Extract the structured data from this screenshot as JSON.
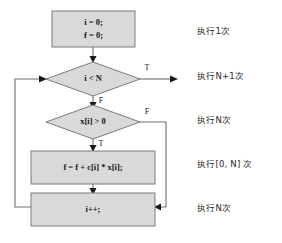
{
  "diagram": {
    "colors": {
      "node_fill": "#d9d9d9",
      "node_stroke": "#7a7a7a",
      "connector": "#6e6e6e",
      "text": "#141414",
      "background": "#ffffff"
    },
    "nodes": {
      "init": {
        "type": "process",
        "line1": "i = 0;",
        "line2": "f = 0;"
      },
      "loop_condition": {
        "type": "decision",
        "text": "i < N",
        "true_label": "T",
        "false_label": "F"
      },
      "value_condition": {
        "type": "decision",
        "text": "x[i] > 0",
        "true_label": "T",
        "false_label": "F"
      },
      "accumulate": {
        "type": "process",
        "text": "f = f + c[i] * x[i];"
      },
      "increment": {
        "type": "process",
        "text": "i++;"
      }
    },
    "annotations": [
      {
        "label": "执行1次"
      },
      {
        "label": "执行N+1次"
      },
      {
        "label": "执行N次"
      },
      {
        "label": "执行[0, N] 次"
      },
      {
        "label": "执行N次"
      }
    ]
  }
}
